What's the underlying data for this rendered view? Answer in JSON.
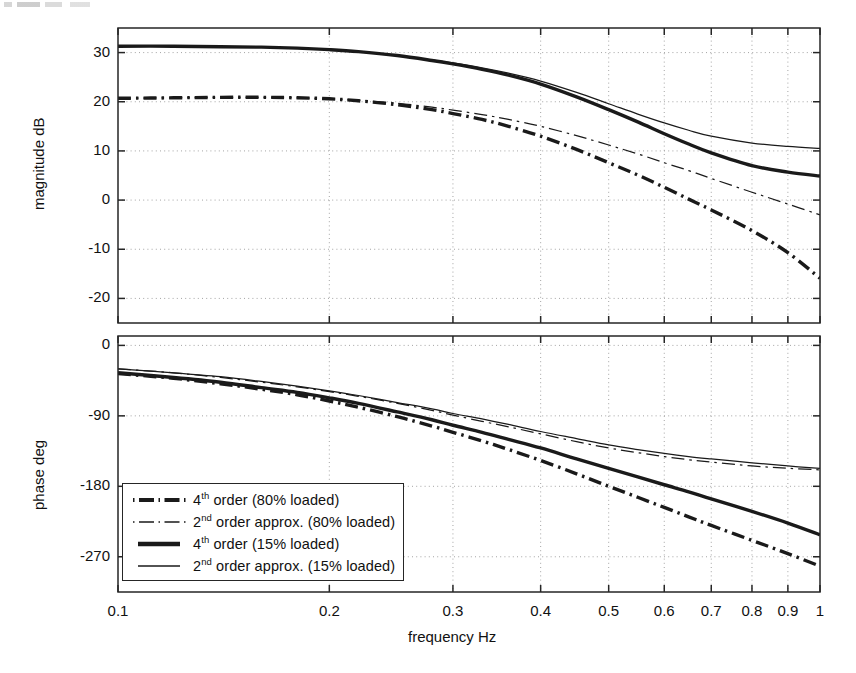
{
  "figure": {
    "title": "",
    "xlabel": "frequency  Hz",
    "legend_position": "lower-left of phase axes"
  },
  "magnitude_axis": {
    "ylabel": "magnitude  dB",
    "yticks": [
      "30",
      "20",
      "10",
      "0",
      "-10",
      "-20"
    ],
    "ylim": [
      -25,
      35
    ]
  },
  "phase_axis": {
    "ylabel": "phase  deg",
    "yticks": [
      "0",
      "-90",
      "-180",
      "-270"
    ],
    "ylim": [
      -315,
      12
    ]
  },
  "xaxis": {
    "ticks": [
      "0.1",
      "0.2",
      "0.3",
      "0.4",
      "0.5",
      "0.6",
      "0.7",
      "0.8",
      "0.9",
      "1"
    ],
    "scale": "log",
    "xlim": [
      0.1,
      1.0
    ],
    "label": "frequency  Hz"
  },
  "legend": {
    "items": [
      {
        "prefix": "4",
        "sup": "th",
        "rest": " order (80% loaded)",
        "style": "thick-dashdot",
        "full": "4th order (80% loaded)"
      },
      {
        "prefix": "2",
        "sup": "nd",
        "rest": " order approx. (80% loaded)",
        "style": "thin-dashdot",
        "full": "2nd order approx. (80% loaded)"
      },
      {
        "prefix": "4",
        "sup": "th",
        "rest": " order (15% loaded)",
        "style": "thick-solid",
        "full": "4th order (15% loaded)"
      },
      {
        "prefix": "2",
        "sup": "nd",
        "rest": " order approx. (15% loaded)",
        "style": "thin-solid",
        "full": "2nd order approx. (15% loaded)"
      }
    ]
  },
  "colors": {
    "line": "#1a1a1a",
    "grid": "#9a9a9a",
    "frame": "#262626",
    "background": "#ffffff"
  },
  "chart_data": {
    "type": "line",
    "title": "",
    "xlabel": "frequency  Hz",
    "ylabel": "magnitude  dB / phase  deg",
    "xscale": "log",
    "xlim": [
      0.1,
      1.0
    ],
    "xticks": [
      0.1,
      0.2,
      0.3,
      0.4,
      0.5,
      0.6,
      0.7,
      0.8,
      0.9,
      1.0
    ],
    "grid": true,
    "legend_position": "lower left",
    "panels": [
      {
        "name": "magnitude",
        "ylabel": "magnitude  dB",
        "ylim": [
          -25,
          35
        ],
        "yticks": [
          30,
          20,
          10,
          0,
          -10,
          -20
        ],
        "x": [
          0.1,
          0.12,
          0.14,
          0.16,
          0.18,
          0.2,
          0.22,
          0.25,
          0.28,
          0.3,
          0.33,
          0.36,
          0.4,
          0.45,
          0.5,
          0.55,
          0.6,
          0.65,
          0.7,
          0.8,
          0.9,
          1.0
        ],
        "series": [
          {
            "name": "4th order (80% loaded)",
            "style": "thick-dashdot",
            "values": [
              20.7,
              20.8,
              20.9,
              20.9,
              20.8,
              20.6,
              20.2,
              19.4,
              18.4,
              17.6,
              16.4,
              15.0,
              13.0,
              10.3,
              7.6,
              5.1,
              2.6,
              0.2,
              -2.0,
              -6.2,
              -10.7,
              -15.9
            ]
          },
          {
            "name": "2nd order approx. (80% loaded)",
            "style": "thin-dashdot",
            "values": [
              20.7,
              20.8,
              20.9,
              20.9,
              20.8,
              20.6,
              20.3,
              19.7,
              18.9,
              18.3,
              17.4,
              16.4,
              15.0,
              13.1,
              11.2,
              9.4,
              7.6,
              6.0,
              4.4,
              1.6,
              -0.8,
              -3.0
            ]
          },
          {
            "name": "4th order (15% loaded)",
            "style": "thick-solid",
            "values": [
              31.3,
              31.3,
              31.2,
              31.1,
              30.9,
              30.6,
              30.2,
              29.4,
              28.4,
              27.7,
              26.6,
              25.4,
              23.6,
              21.0,
              18.4,
              15.9,
              13.5,
              11.4,
              9.6,
              7.0,
              5.7,
              4.9
            ]
          },
          {
            "name": "2nd order approx. (15% loaded)",
            "style": "thin-solid",
            "values": [
              31.3,
              31.3,
              31.2,
              31.1,
              30.9,
              30.6,
              30.2,
              29.4,
              28.5,
              27.9,
              26.9,
              25.8,
              24.2,
              21.9,
              19.6,
              17.5,
              15.7,
              14.2,
              13.0,
              11.6,
              10.9,
              10.5
            ]
          }
        ]
      },
      {
        "name": "phase",
        "ylabel": "phase  deg",
        "ylim": [
          -315,
          12
        ],
        "yticks": [
          0,
          -90,
          -180,
          -270
        ],
        "x": [
          0.1,
          0.12,
          0.14,
          0.16,
          0.18,
          0.2,
          0.22,
          0.25,
          0.28,
          0.3,
          0.33,
          0.36,
          0.4,
          0.45,
          0.5,
          0.55,
          0.6,
          0.65,
          0.7,
          0.8,
          0.9,
          1.0
        ],
        "series": [
          {
            "name": "4th order (80% loaded)",
            "style": "thick-dashdot",
            "values": [
              -36,
              -42,
              -49,
              -56,
              -63,
              -71,
              -79,
              -91,
              -103,
              -111,
              -122,
              -133,
              -147,
              -164,
              -180,
              -194,
              -207,
              -219,
              -230,
              -249,
              -266,
              -282
            ]
          },
          {
            "name": "2nd order approx. (80% loaded)",
            "style": "thin-dashdot",
            "values": [
              -30,
              -35,
              -41,
              -47,
              -53,
              -59,
              -65,
              -74,
              -83,
              -89,
              -97,
              -104,
              -113,
              -123,
              -131,
              -137,
              -142,
              -146,
              -149,
              -154,
              -157,
              -159
            ]
          },
          {
            "name": "4th order (15% loaded)",
            "style": "thick-solid",
            "values": [
              -35,
              -41,
              -47,
              -54,
              -60,
              -67,
              -74,
              -85,
              -95,
              -102,
              -111,
              -120,
              -131,
              -145,
              -157,
              -168,
              -178,
              -187,
              -196,
              -212,
              -227,
              -242
            ]
          },
          {
            "name": "2nd order approx. (15% loaded)",
            "style": "thin-solid",
            "values": [
              -30,
              -35,
              -40,
              -46,
              -52,
              -58,
              -64,
              -73,
              -81,
              -87,
              -94,
              -101,
              -110,
              -119,
              -127,
              -133,
              -138,
              -142,
              -145,
              -150,
              -154,
              -157
            ]
          }
        ]
      }
    ]
  }
}
